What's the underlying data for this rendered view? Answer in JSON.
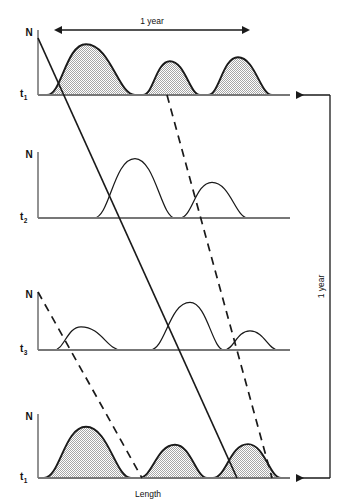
{
  "figure": {
    "title": "",
    "x_axis_label": "Length",
    "y_axis_label": "N",
    "horizontal_span_label": "1 year",
    "vertical_span_label": "1 year",
    "colors": {
      "curve_stroke": "#1a1a1a",
      "baseline": "#777777",
      "axis": "#777777",
      "fill_pattern": "#9a9a9a",
      "background": "#ffffff",
      "text": "#111111"
    }
  },
  "chart_data": {
    "type": "line",
    "title": "",
    "xlabel": "Length",
    "ylabel": "N",
    "grid": false,
    "legend": "none",
    "xlim": [
      0,
      260
    ],
    "ylim": [
      0,
      1
    ],
    "annotations": [
      {
        "name": "horizontal-span",
        "label": "1 year",
        "orientation": "horizontal",
        "x_start": 62,
        "x_end": 242,
        "y": 30,
        "arrows": "both"
      },
      {
        "name": "vertical-span",
        "label": "1 year",
        "orientation": "vertical",
        "y_start": 95,
        "y_end": 478,
        "x": 330,
        "arrows": "both"
      }
    ],
    "panels": [
      {
        "id": "panel-t1-top",
        "time_label": "t1",
        "time_label_base": "t",
        "time_label_sub": "1",
        "baseline_y": 95,
        "axis_top_y": 30,
        "filled": true,
        "modes": [
          {
            "name": "cohort-a",
            "x_start": 47,
            "x_peak": 86,
            "x_end": 135,
            "height": 0.78
          },
          {
            "name": "cohort-b",
            "x_start": 143,
            "x_peak": 170,
            "x_end": 200,
            "height": 0.52
          },
          {
            "name": "cohort-c",
            "x_start": 208,
            "x_peak": 238,
            "x_end": 272,
            "height": 0.58
          }
        ]
      },
      {
        "id": "panel-t2",
        "time_label": "t2",
        "time_label_base": "t",
        "time_label_sub": "2",
        "baseline_y": 218,
        "axis_top_y": 152,
        "filled": false,
        "modes": [
          {
            "name": "cohort-a",
            "x_start": 94,
            "x_peak": 135,
            "x_end": 175,
            "height": 0.9
          },
          {
            "name": "cohort-b",
            "x_start": 180,
            "x_peak": 212,
            "x_end": 248,
            "height": 0.54
          }
        ]
      },
      {
        "id": "panel-t3",
        "time_label": "t3",
        "time_label_base": "t",
        "time_label_sub": "3",
        "baseline_y": 350,
        "axis_top_y": 292,
        "filled": false,
        "modes": [
          {
            "name": "cohort-a",
            "x_start": 54,
            "x_peak": 81,
            "x_end": 121,
            "height": 0.4
          },
          {
            "name": "cohort-b",
            "x_start": 150,
            "x_peak": 190,
            "x_end": 224,
            "height": 0.82
          },
          {
            "name": "cohort-c",
            "x_start": 224,
            "x_peak": 250,
            "x_end": 278,
            "height": 0.33
          }
        ]
      },
      {
        "id": "panel-t1-bottom",
        "time_label": "t1",
        "time_label_base": "t",
        "time_label_sub": "1",
        "baseline_y": 478,
        "axis_top_y": 414,
        "filled": true,
        "modes": [
          {
            "name": "cohort-a",
            "x_start": 44,
            "x_peak": 86,
            "x_end": 131,
            "height": 0.8
          },
          {
            "name": "cohort-b",
            "x_start": 139,
            "x_peak": 175,
            "x_end": 207,
            "height": 0.52
          },
          {
            "name": "cohort-c",
            "x_start": 213,
            "x_peak": 248,
            "x_end": 281,
            "height": 0.53
          }
        ]
      }
    ],
    "cohort_tracks": [
      {
        "name": "solid-cohort-track",
        "style": "solid",
        "x1": 38,
        "y1": 38,
        "x2": 237,
        "y2": 478
      },
      {
        "name": "dashed-cohort-track",
        "style": "dashed",
        "x1": 167,
        "y1": 95,
        "x2": 272,
        "y2": 478
      },
      {
        "name": "dashed-cohort-track-lower",
        "style": "dashed",
        "x1": 38,
        "y1": 292,
        "x2": 142,
        "y2": 478
      }
    ]
  }
}
